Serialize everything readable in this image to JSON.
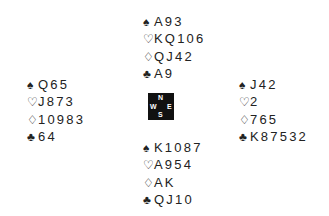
{
  "hands": {
    "north": {
      "spades": "A93",
      "hearts": "KQ106",
      "diamonds": "QJ42",
      "clubs": "A9"
    },
    "west": {
      "spades": "Q65",
      "hearts": "J873",
      "diamonds": "10983",
      "clubs": "64"
    },
    "east": {
      "spades": "J42",
      "hearts": "2",
      "diamonds": "765",
      "clubs": "K87532"
    },
    "south": {
      "spades": "K1087",
      "hearts": "A954",
      "diamonds": "AK",
      "clubs": "QJ10"
    }
  },
  "suits": {
    "spades": "♠",
    "hearts": "♡",
    "diamonds": "♢",
    "clubs": "♣"
  },
  "compass": {
    "n": "N",
    "s": "S",
    "w": "W",
    "e": "E"
  }
}
